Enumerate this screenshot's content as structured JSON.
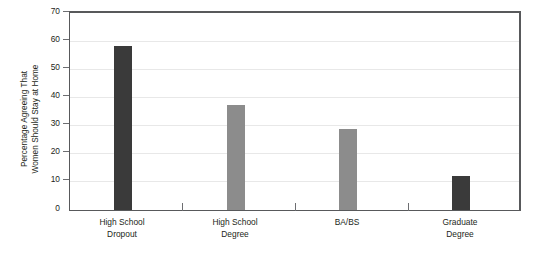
{
  "chart_data": {
    "type": "bar",
    "title": "",
    "subtitle": "",
    "xlabel": "",
    "ylabel": "Percentage Agreeing That Women Should Stay at Home",
    "ylabel_lines": [
      "Percentage Agreeing That",
      "Women Should Stay at Home"
    ],
    "categories": [
      "High School Dropout",
      "High School Degree",
      "BA/BS",
      "Graduate Degree"
    ],
    "category_lines": [
      [
        "High School",
        "Dropout"
      ],
      [
        "High School",
        "Degree"
      ],
      [
        "BA/BS",
        ""
      ],
      [
        "Graduate",
        "Degree"
      ]
    ],
    "values": [
      58,
      37,
      28.5,
      12
    ],
    "bar_colors": [
      "#3a3a3a",
      "#8c8c8c",
      "#8c8c8c",
      "#3a3a3a"
    ],
    "ylim": [
      0,
      70
    ],
    "yticks": [
      0,
      10,
      20,
      30,
      40,
      50,
      60,
      70
    ],
    "ytick_labels": [
      "0",
      "10",
      "20",
      "30",
      "40",
      "50",
      "60",
      "70"
    ],
    "grid": true,
    "grid_color": "#e8e8e8",
    "legend": false,
    "legend_position": "none",
    "axis_color": "#58595b",
    "text_color": "#231f20",
    "background": "#ffffff"
  }
}
